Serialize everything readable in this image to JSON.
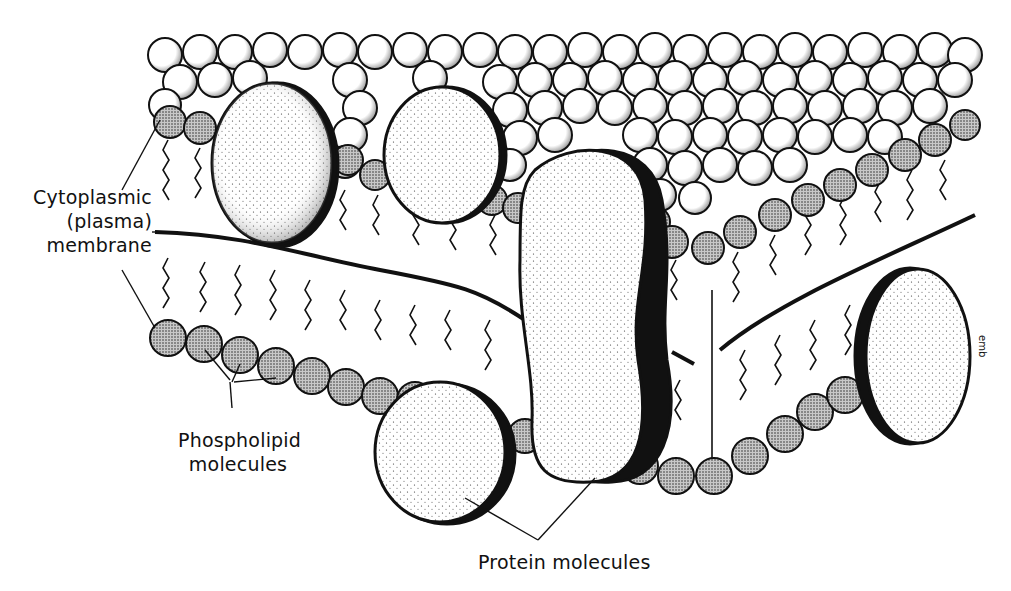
{
  "figure": {
    "labels": {
      "membrane": [
        "Cytoplasmic",
        "(plasma)",
        "membrane"
      ],
      "phospholipid": [
        "Phospholipid",
        "molecules"
      ],
      "protein": "Protein molecules"
    },
    "signature": "emb",
    "colors": {
      "ink": "#111111",
      "background": "#ffffff",
      "head_fill": "#9a9a9a",
      "sphere_fill": "#ffffff"
    }
  }
}
